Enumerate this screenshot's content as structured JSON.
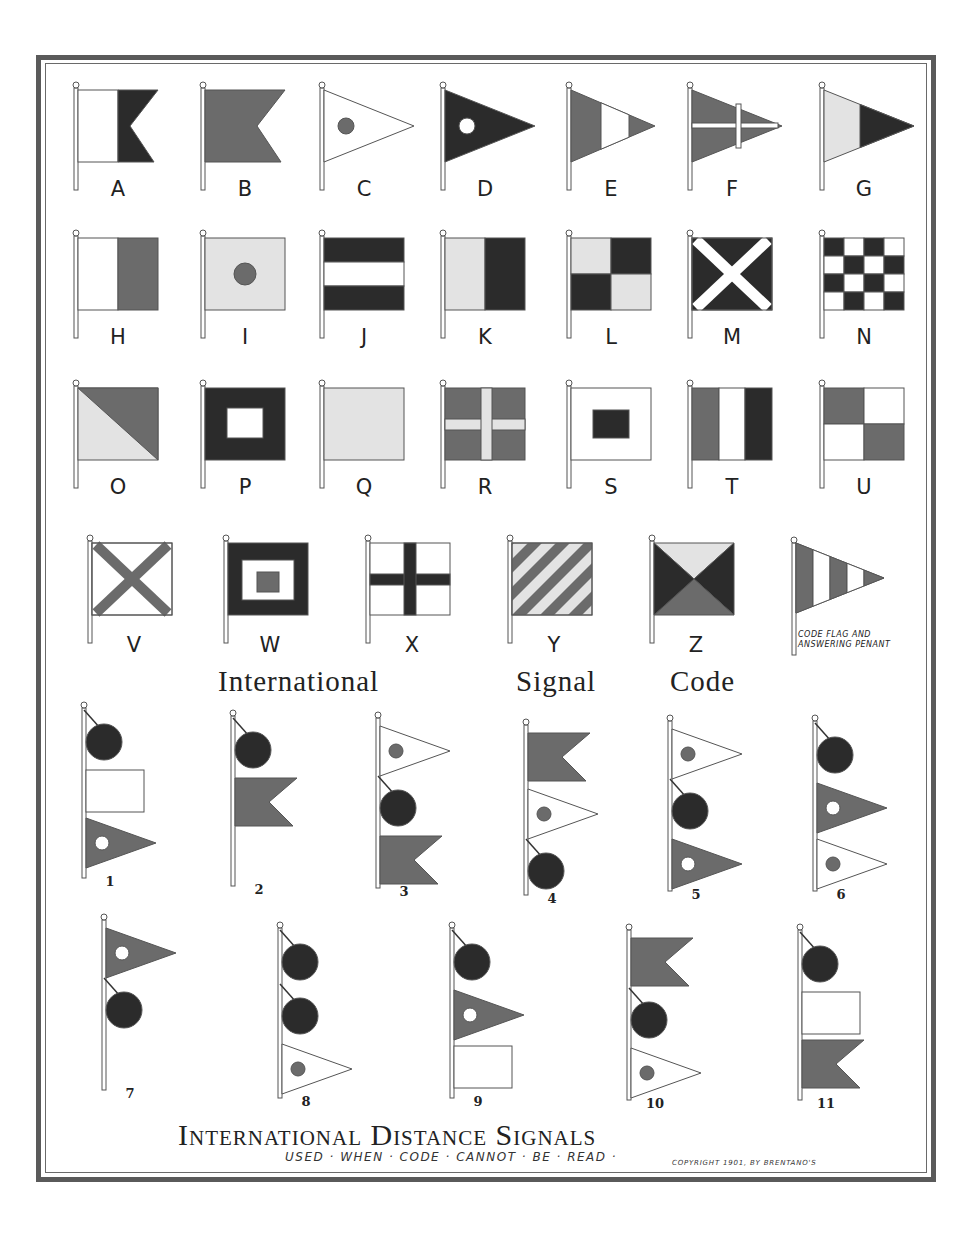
{
  "page": {
    "title_code": "International Signal Code",
    "title_code_words": [
      "International",
      "Signal",
      "Code"
    ],
    "title_distance": "International Distance Signals",
    "subtitle": "USED · WHEN · CODE · CANNOT · BE · READ ·",
    "copyright": "COPYRIGHT 1901, BY BRENTANO'S",
    "code_flag_caption_line1": "CODE FLAG AND",
    "code_flag_caption_line2": "ANSWERING PENANT"
  },
  "colors": {
    "dark": "#2b2b2b",
    "mid": "#6b6b6b",
    "light": "#e3e3e3",
    "white": "#ffffff",
    "outline": "#555555",
    "frame": "#5a5a5a"
  },
  "letter_flags": [
    {
      "letter": "A",
      "shape": "swallowtail",
      "design": "white hoist, dark fly"
    },
    {
      "letter": "B",
      "shape": "swallowtail",
      "design": "solid mid"
    },
    {
      "letter": "C",
      "shape": "pennant",
      "design": "white with mid ball"
    },
    {
      "letter": "D",
      "shape": "pennant",
      "design": "dark with white ball"
    },
    {
      "letter": "E",
      "shape": "pennant",
      "design": "mid, white, dark vertical bands"
    },
    {
      "letter": "F",
      "shape": "pennant",
      "design": "mid with white cross"
    },
    {
      "letter": "G",
      "shape": "pennant",
      "design": "light hoist, dark fly"
    },
    {
      "letter": "H",
      "shape": "square",
      "design": "white hoist, mid fly"
    },
    {
      "letter": "I",
      "shape": "square",
      "design": "light with mid ball"
    },
    {
      "letter": "J",
      "shape": "square",
      "design": "dark, white, dark horizontal"
    },
    {
      "letter": "K",
      "shape": "square",
      "design": "light hoist, dark fly"
    },
    {
      "letter": "L",
      "shape": "square",
      "design": "light/dark quarters"
    },
    {
      "letter": "M",
      "shape": "square",
      "design": "dark with white saltire"
    },
    {
      "letter": "N",
      "shape": "square",
      "design": "dark/white checkers 4x4"
    },
    {
      "letter": "O",
      "shape": "square",
      "design": "diagonal light lower / mid upper"
    },
    {
      "letter": "P",
      "shape": "square",
      "design": "dark with white center"
    },
    {
      "letter": "Q",
      "shape": "square",
      "design": "solid light"
    },
    {
      "letter": "R",
      "shape": "square",
      "design": "mid with light cross"
    },
    {
      "letter": "S",
      "shape": "square",
      "design": "white with dark center"
    },
    {
      "letter": "T",
      "shape": "square",
      "design": "mid, white, dark vertical"
    },
    {
      "letter": "U",
      "shape": "square",
      "design": "mid/white quarters"
    },
    {
      "letter": "V",
      "shape": "square",
      "design": "white with mid saltire"
    },
    {
      "letter": "W",
      "shape": "square",
      "design": "dark, white, mid concentric"
    },
    {
      "letter": "X",
      "shape": "square",
      "design": "white with dark cross"
    },
    {
      "letter": "Y",
      "shape": "square",
      "design": "diagonal mid/light stripes"
    },
    {
      "letter": "Z",
      "shape": "square",
      "design": "four triangles"
    }
  ],
  "code_flag": {
    "label": "CODE FLAG AND ANSWERING PENANT",
    "design": "pennant mid/white vertical bands"
  },
  "distance_signals": [
    {
      "number": "1",
      "hoist": [
        "ball",
        "white oblong flag",
        "mid pennant with white ball"
      ]
    },
    {
      "number": "2",
      "hoist": [
        "ball",
        "mid swallowtail"
      ]
    },
    {
      "number": "3",
      "hoist": [
        "white pennant with mid ball",
        "ball",
        "mid swallowtail"
      ]
    },
    {
      "number": "4",
      "hoist": [
        "mid swallowtail",
        "white pennant with mid ball",
        "ball"
      ]
    },
    {
      "number": "5",
      "hoist": [
        "white pennant with mid ball",
        "ball",
        "mid pennant with white ball"
      ]
    },
    {
      "number": "6",
      "hoist": [
        "ball",
        "mid pennant with white ball",
        "white pennant with mid ball"
      ]
    },
    {
      "number": "7",
      "hoist": [
        "mid pennant with white ball",
        "ball"
      ]
    },
    {
      "number": "8",
      "hoist": [
        "ball",
        "ball",
        "white pennant with mid ball"
      ]
    },
    {
      "number": "9",
      "hoist": [
        "ball",
        "mid pennant with white ball",
        "white oblong flag"
      ]
    },
    {
      "number": "10",
      "hoist": [
        "mid swallowtail",
        "ball",
        "white pennant with mid ball"
      ]
    },
    {
      "number": "11",
      "hoist": [
        "ball",
        "white oblong flag",
        "mid swallowtail"
      ]
    }
  ]
}
